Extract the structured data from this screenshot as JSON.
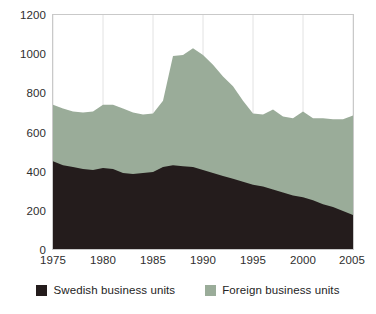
{
  "chart_data": {
    "type": "area",
    "stacked": true,
    "title": "",
    "subtitle": "",
    "xlabel": "",
    "ylabel": "",
    "xlim": [
      1975,
      2005
    ],
    "ylim": [
      0,
      1200
    ],
    "grid": "vertical",
    "legend_position": "bottom",
    "x_tick_labels": [
      "1975",
      "1980",
      "1985",
      "1990",
      "1995",
      "2000",
      "2005"
    ],
    "x_ticks": [
      1975,
      1980,
      1985,
      1990,
      1995,
      2000,
      2005
    ],
    "y_tick_labels": [
      "0",
      "200",
      "400",
      "600",
      "800",
      "1000",
      "1200"
    ],
    "y_ticks": [
      0,
      200,
      400,
      600,
      800,
      1000,
      1200
    ],
    "colors": {
      "swedish": "#241c1c",
      "foreign": "#9aac99",
      "frame": "#c9c9c9",
      "gridline": "#e2e2e2",
      "background": "#ffffff"
    },
    "x": [
      1975,
      1976,
      1977,
      1978,
      1979,
      1980,
      1981,
      1982,
      1983,
      1984,
      1985,
      1986,
      1987,
      1988,
      1989,
      1990,
      1991,
      1992,
      1993,
      1994,
      1995,
      1996,
      1997,
      1998,
      1999,
      2000,
      2001,
      2002,
      2003,
      2004,
      2005
    ],
    "series": [
      {
        "name": "Swedish business units",
        "color": "#241c1c",
        "values": [
          450,
          430,
          420,
          410,
          405,
          415,
          410,
          390,
          385,
          390,
          395,
          420,
          430,
          425,
          420,
          405,
          390,
          375,
          360,
          345,
          330,
          320,
          305,
          290,
          275,
          265,
          250,
          230,
          215,
          195,
          175
        ]
      },
      {
        "name": "Foreign business units",
        "color": "#9aac99",
        "values": [
          290,
          290,
          285,
          290,
          300,
          325,
          330,
          330,
          315,
          300,
          300,
          340,
          560,
          570,
          610,
          590,
          555,
          510,
          475,
          415,
          365,
          370,
          410,
          390,
          395,
          440,
          420,
          440,
          450,
          470,
          510
        ]
      }
    ],
    "totals": [
      740,
      720,
      705,
      700,
      705,
      740,
      740,
      720,
      700,
      690,
      695,
      760,
      990,
      995,
      1030,
      995,
      945,
      885,
      835,
      760,
      695,
      690,
      715,
      680,
      670,
      705,
      670,
      670,
      665,
      665,
      685
    ]
  },
  "legend": {
    "entries": [
      {
        "label": "Swedish business units",
        "swatch_name": "legend-swatch-swedish"
      },
      {
        "label": "Foreign business units",
        "swatch_name": "legend-swatch-foreign"
      }
    ]
  }
}
